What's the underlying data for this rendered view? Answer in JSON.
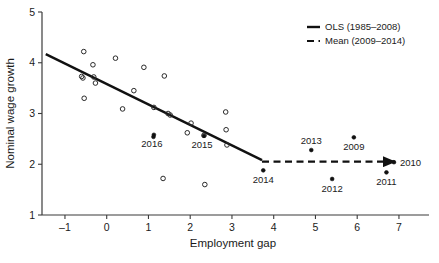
{
  "chart_data": {
    "type": "scatter",
    "title": "",
    "xlabel": "Employment gap",
    "ylabel": "Nominal wage growth",
    "xlim": [
      -1.55,
      7.6
    ],
    "ylim": [
      1,
      5
    ],
    "xticks": [
      -1,
      0,
      1,
      2,
      3,
      4,
      5,
      6,
      7
    ],
    "xticklabels": [
      "–1",
      "0",
      "1",
      "2",
      "3",
      "4",
      "5",
      "6",
      "7"
    ],
    "yticks": [
      1,
      2,
      3,
      4,
      5
    ],
    "yticklabels": [
      "1",
      "2",
      "3",
      "4",
      "5"
    ],
    "grid": false,
    "legend_position": "top-right",
    "legend": [
      {
        "label": "OLS (1985–2008)",
        "style": "solid"
      },
      {
        "label": "Mean (2009–2014)",
        "style": "dashed"
      }
    ],
    "series": [
      {
        "name": "1985-2008 observations",
        "marker": "open-circle",
        "points": [
          {
            "x": -0.55,
            "y": 4.22
          },
          {
            "x": -0.33,
            "y": 3.96
          },
          {
            "x": 0.21,
            "y": 4.09
          },
          {
            "x": 0.89,
            "y": 3.91
          },
          {
            "x": 1.38,
            "y": 3.74
          },
          {
            "x": -0.6,
            "y": 3.73
          },
          {
            "x": -0.57,
            "y": 3.7
          },
          {
            "x": -0.31,
            "y": 3.72
          },
          {
            "x": -0.27,
            "y": 3.6
          },
          {
            "x": -0.54,
            "y": 3.3
          },
          {
            "x": 0.65,
            "y": 3.45
          },
          {
            "x": 0.38,
            "y": 3.09
          },
          {
            "x": 1.13,
            "y": 3.12
          },
          {
            "x": 1.47,
            "y": 3.0
          },
          {
            "x": 1.52,
            "y": 2.97
          },
          {
            "x": 2.85,
            "y": 3.03
          },
          {
            "x": 2.02,
            "y": 2.81
          },
          {
            "x": 2.86,
            "y": 2.68
          },
          {
            "x": 1.93,
            "y": 2.62
          },
          {
            "x": 2.33,
            "y": 2.57
          },
          {
            "x": 2.88,
            "y": 2.38
          },
          {
            "x": 1.35,
            "y": 1.72
          },
          {
            "x": 2.35,
            "y": 1.6
          }
        ]
      },
      {
        "name": "labelled years",
        "marker": "filled-circle",
        "points": [
          {
            "x": 1.13,
            "y": 2.58,
            "label": "2016",
            "label_pos": "below-left"
          },
          {
            "x": 1.12,
            "y": 2.54,
            "label": "",
            "label_pos": "none"
          },
          {
            "x": 2.33,
            "y": 2.56,
            "label": "2015",
            "label_pos": "below-left"
          },
          {
            "x": 3.75,
            "y": 1.88,
            "label": "2014",
            "label_pos": "below"
          },
          {
            "x": 4.9,
            "y": 2.28,
            "label": "2013",
            "label_pos": "above"
          },
          {
            "x": 5.4,
            "y": 1.71,
            "label": "2012",
            "label_pos": "below"
          },
          {
            "x": 6.7,
            "y": 1.84,
            "label": "2011",
            "label_pos": "below"
          },
          {
            "x": 5.92,
            "y": 2.53,
            "label": "2009",
            "label_pos": "below"
          },
          {
            "x": 6.88,
            "y": 2.04,
            "label": "2010",
            "label_pos": "right"
          }
        ]
      }
    ],
    "fit_lines": [
      {
        "name": "OLS (1985-2008)",
        "style": "solid",
        "x1": -1.46,
        "y1": 4.17,
        "x2": 3.72,
        "y2": 2.08
      },
      {
        "name": "Mean (2009-2014)",
        "style": "dashed",
        "arrow": true,
        "x1": 3.72,
        "y1": 2.05,
        "x2": 6.9,
        "y2": 2.05
      }
    ]
  }
}
